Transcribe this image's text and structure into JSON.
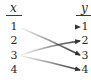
{
  "diagram": {
    "type": "mapping-diagram",
    "domain_header": "x",
    "range_header": "y",
    "domain": [
      "1",
      "2",
      "3",
      "4"
    ],
    "range": [
      "1",
      "2",
      "3",
      "4"
    ],
    "mappings": [
      {
        "from": "1",
        "to": "1"
      },
      {
        "from": "1",
        "to": "3"
      },
      {
        "from": "3",
        "to": "2"
      },
      {
        "from": "3",
        "to": "4"
      }
    ],
    "arrow_color": "#333333"
  }
}
